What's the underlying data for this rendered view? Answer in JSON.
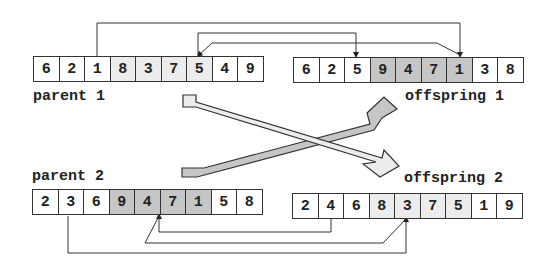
{
  "parent1": {
    "label": "parent 1",
    "genes": [
      {
        "value": "6",
        "shade": "none"
      },
      {
        "value": "2",
        "shade": "none"
      },
      {
        "value": "1",
        "shade": "none"
      },
      {
        "value": "8",
        "shade": "light"
      },
      {
        "value": "3",
        "shade": "light"
      },
      {
        "value": "7",
        "shade": "light"
      },
      {
        "value": "5",
        "shade": "light"
      },
      {
        "value": "4",
        "shade": "none"
      },
      {
        "value": "9",
        "shade": "none"
      }
    ]
  },
  "offspring1": {
    "label": "offspring 1",
    "genes": [
      {
        "value": "6",
        "shade": "none"
      },
      {
        "value": "2",
        "shade": "none"
      },
      {
        "value": "5",
        "shade": "none"
      },
      {
        "value": "9",
        "shade": "dark"
      },
      {
        "value": "4",
        "shade": "dark"
      },
      {
        "value": "7",
        "shade": "dark"
      },
      {
        "value": "1",
        "shade": "dark"
      },
      {
        "value": "3",
        "shade": "none"
      },
      {
        "value": "8",
        "shade": "none"
      }
    ]
  },
  "parent2": {
    "label": "parent 2",
    "genes": [
      {
        "value": "2",
        "shade": "none"
      },
      {
        "value": "3",
        "shade": "none"
      },
      {
        "value": "6",
        "shade": "none"
      },
      {
        "value": "9",
        "shade": "dark"
      },
      {
        "value": "4",
        "shade": "dark"
      },
      {
        "value": "7",
        "shade": "dark"
      },
      {
        "value": "1",
        "shade": "dark"
      },
      {
        "value": "5",
        "shade": "none"
      },
      {
        "value": "8",
        "shade": "none"
      }
    ]
  },
  "offspring2": {
    "label": "offspring 2",
    "genes": [
      {
        "value": "2",
        "shade": "none"
      },
      {
        "value": "4",
        "shade": "none"
      },
      {
        "value": "6",
        "shade": "none"
      },
      {
        "value": "8",
        "shade": "light"
      },
      {
        "value": "3",
        "shade": "light"
      },
      {
        "value": "7",
        "shade": "light"
      },
      {
        "value": "5",
        "shade": "light"
      },
      {
        "value": "1",
        "shade": "none"
      },
      {
        "value": "9",
        "shade": "none"
      }
    ]
  },
  "colors": {
    "light_segment": "#ececec",
    "dark_segment": "#c6c6c6",
    "line": "#333333"
  }
}
